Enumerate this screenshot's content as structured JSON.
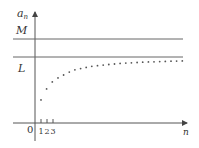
{
  "diagram": {
    "y_axis_label": "a",
    "y_axis_subscript": "n",
    "x_axis_label": "n",
    "origin_label": "0",
    "upper_bound_label": "M",
    "limit_label": "L",
    "x_ticks": [
      "1",
      "2",
      "3"
    ],
    "colors": {
      "axis": "#555555",
      "line": "#666666",
      "dot": "#555555",
      "text": "#333333"
    }
  },
  "chart_data": {
    "type": "scatter",
    "title": "",
    "xlabel": "n",
    "ylabel": "a_n",
    "tick_labels_x": [
      "1",
      "2",
      "3"
    ],
    "horizontal_lines": [
      {
        "label": "M",
        "meaning": "upper bound"
      },
      {
        "label": "L",
        "meaning": "limit"
      }
    ],
    "x": [
      1,
      2,
      3,
      4,
      5,
      6,
      7,
      8,
      9,
      10,
      11,
      12,
      13,
      14,
      15,
      16,
      17,
      18,
      19,
      20,
      21,
      22,
      23,
      24,
      25,
      26
    ],
    "y_relative_to_L": [
      -0.74,
      -0.55,
      -0.43,
      -0.36,
      -0.31,
      -0.26,
      -0.22,
      -0.2,
      -0.18,
      -0.16,
      -0.15,
      -0.14,
      -0.13,
      -0.12,
      -0.11,
      -0.105,
      -0.1,
      -0.095,
      -0.09,
      -0.085,
      -0.082,
      -0.079,
      -0.076,
      -0.073,
      -0.07,
      -0.068
    ],
    "grid": false
  }
}
